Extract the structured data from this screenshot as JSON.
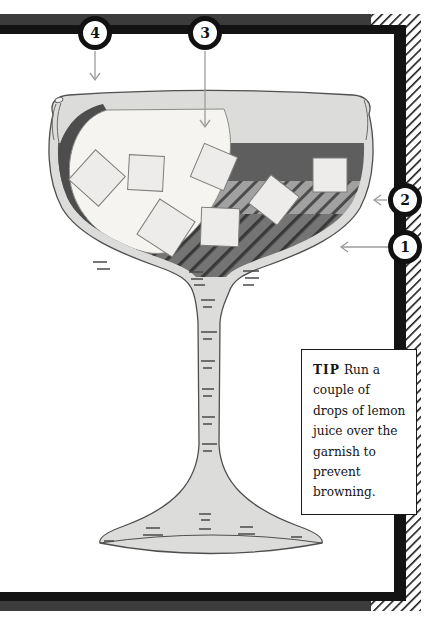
{
  "figure": {
    "type": "cocktail-coupe-diagram",
    "callouts": [
      {
        "number": "1"
      },
      {
        "number": "2"
      },
      {
        "number": "3"
      },
      {
        "number": "4"
      }
    ],
    "tip": {
      "label": "TIP",
      "text": "Run a couple of drops of lemon juice over the garnish to prevent browning."
    },
    "colors": {
      "frame_black": "#131313",
      "frame_gray": "#3c3c3c",
      "glass_fill": "#dcdcda",
      "layer_dark_band": "#5e5e5e",
      "layer_mid_hatch_bg": "#a1a1a1",
      "layer_bottom_hatch_bg": "#747474",
      "garnish_flesh": "#f5f4f1",
      "garnish_skin": "#4d4d4d",
      "ice_cube": "#edecea",
      "arrow_gray": "#9b9b9b"
    }
  }
}
